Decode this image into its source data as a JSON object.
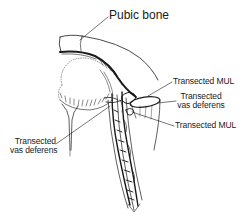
{
  "figure": {
    "labels": {
      "pubic_bone": "Pubic bone",
      "transected_mul_upper": "Transected MUL",
      "transected_vas_right_line1": "Transected",
      "transected_vas_right_line2": "vas deferens",
      "transected_mul_lower": "Transected MUL",
      "transected_vas_left_line1": "Transected",
      "transected_vas_left_line2": "vas deferens"
    },
    "colors": {
      "ink": "#1a1a1a",
      "background": "#ffffff"
    }
  }
}
